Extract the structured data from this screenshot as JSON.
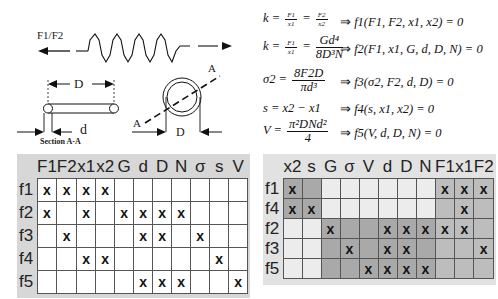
{
  "diagram": {
    "force_label": "F1/F2",
    "dim_D_top": "D",
    "dim_d": "d",
    "section_label": "Section A-A",
    "section_mark_A1": "A",
    "section_mark_A2": "A",
    "dim_D_ring": "D"
  },
  "equations": [
    {
      "lhs_var": "k",
      "frac1_num": "F1",
      "frac1_den": "x1",
      "frac2_num": "F2",
      "frac2_den": "x2",
      "implies": "⇒",
      "rhs": "f1(F1, F2, x1, x2) = 0"
    },
    {
      "lhs_var": "k",
      "frac1_num": "F1",
      "frac1_den": "x1",
      "frac2_num": "Gd⁴",
      "frac2_den": "8D³N",
      "implies": "⇒",
      "rhs": "f2(F1, x1, G, d, D, N) = 0"
    },
    {
      "lhs_var": "σ2",
      "frac_num": "8F2D",
      "frac_den": "πd³",
      "implies": "⇒",
      "rhs": "f3(σ2, F2, d, D) = 0"
    },
    {
      "lhs": "s = x2 − x1",
      "implies": "⇒",
      "rhs": "f4(s, x1, x2) = 0"
    },
    {
      "lhs_var": "V",
      "frac_num": "π²DNd²",
      "frac_den": "4",
      "implies": "⇒",
      "rhs": "f5(V, d, D, N) = 0"
    }
  ],
  "left_matrix": {
    "columns": [
      "F1",
      "F2",
      "x1",
      "x2",
      "G",
      "d",
      "D",
      "N",
      "σ",
      "s",
      "V"
    ],
    "rows": [
      {
        "label": "f1",
        "cells": [
          "x",
          "x",
          "x",
          "x",
          "",
          "",
          "",
          "",
          "",
          "",
          ""
        ]
      },
      {
        "label": "f2",
        "cells": [
          "x",
          "",
          "x",
          "",
          "x",
          "x",
          "x",
          "x",
          "",
          "",
          ""
        ]
      },
      {
        "label": "f3",
        "cells": [
          "",
          "x",
          "",
          "",
          "",
          "x",
          "x",
          "",
          "x",
          "",
          ""
        ]
      },
      {
        "label": "f4",
        "cells": [
          "",
          "",
          "x",
          "x",
          "",
          "",
          "",
          "",
          "",
          "x",
          ""
        ]
      },
      {
        "label": "f5",
        "cells": [
          "",
          "",
          "",
          "",
          "",
          "x",
          "x",
          "x",
          "",
          "",
          "x"
        ]
      }
    ]
  },
  "right_matrix": {
    "columns": [
      "x2",
      "s",
      "G",
      "σ",
      "V",
      "d",
      "D",
      "N",
      "F1",
      "x1",
      "F2"
    ],
    "rows": [
      {
        "label": "f1",
        "cells": [
          "x",
          "",
          "",
          "",
          "",
          "",
          "",
          "",
          "x",
          "x",
          "x"
        ]
      },
      {
        "label": "f4",
        "cells": [
          "x",
          "x",
          "",
          "",
          "",
          "",
          "",
          "",
          "",
          "x",
          ""
        ]
      },
      {
        "label": "f2",
        "cells": [
          "",
          "",
          "x",
          "",
          "",
          "x",
          "x",
          "x",
          "x",
          "x",
          ""
        ]
      },
      {
        "label": "f3",
        "cells": [
          "",
          "",
          "",
          "x",
          "",
          "x",
          "x",
          "",
          "",
          "",
          "x"
        ]
      },
      {
        "label": "f5",
        "cells": [
          "",
          "",
          "",
          "",
          "x",
          "x",
          "x",
          "x",
          "",
          "",
          ""
        ]
      }
    ],
    "shade": {
      "dark": "#a9a9a9",
      "mid": "#bdbdbd",
      "light": "#ececec"
    }
  }
}
